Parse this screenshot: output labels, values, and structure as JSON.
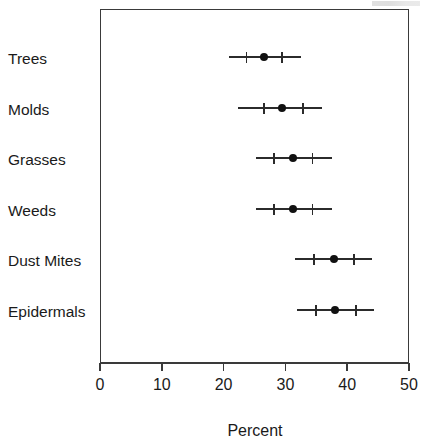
{
  "chart_data": {
    "type": "scatter",
    "title": "",
    "subtitle": "",
    "xlabel": "Percent",
    "ylabel": "",
    "xlim": [
      0,
      50
    ],
    "xticks": [
      0,
      10,
      20,
      30,
      40,
      50
    ],
    "xtick_labels": [
      "0",
      "10",
      "20",
      "30",
      "40",
      "50"
    ],
    "grid": false,
    "legend": "none",
    "orientation": "horizontal",
    "marker": "filled-circle",
    "categories": [
      "Trees",
      "Molds",
      "Grasses",
      "Weeds",
      "Dust Mites",
      "Epidermals"
    ],
    "values": [
      26.5,
      29.4,
      31.2,
      31.2,
      37.8,
      38.1
    ],
    "series": [
      {
        "name": "Percent",
        "points": [
          {
            "category": "Trees",
            "value": 26.5,
            "outer_low": 20.8,
            "inner_low": 23.7,
            "inner_high": 29.4,
            "outer_high": 32.6
          },
          {
            "category": "Molds",
            "value": 29.4,
            "outer_low": 22.4,
            "inner_low": 26.5,
            "inner_high": 32.8,
            "outer_high": 35.9
          },
          {
            "category": "Grasses",
            "value": 31.2,
            "outer_low": 25.3,
            "inner_low": 28.2,
            "inner_high": 34.4,
            "outer_high": 37.5
          },
          {
            "category": "Weeds",
            "value": 31.2,
            "outer_low": 25.3,
            "inner_low": 28.2,
            "inner_high": 34.4,
            "outer_high": 37.5
          },
          {
            "category": "Dust Mites",
            "value": 37.8,
            "outer_low": 31.5,
            "inner_low": 34.6,
            "inner_high": 41.1,
            "outer_high": 44.0
          },
          {
            "category": "Epidermals",
            "value": 38.1,
            "outer_low": 31.8,
            "inner_low": 34.9,
            "inner_high": 41.4,
            "outer_high": 44.3
          }
        ]
      }
    ]
  }
}
